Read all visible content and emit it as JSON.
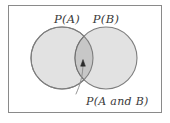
{
  "figure": {
    "type": "venn-diagram",
    "caption_set_a": "P(A)",
    "caption_set_b": "P(B)",
    "caption_intersection": "P(A and B)",
    "frame": {
      "x": 8,
      "y": 5,
      "width": 154,
      "height": 108,
      "border_color": "#8a8a8a",
      "background_color": "#ffffff"
    },
    "circles": [
      {
        "name": "circle-a",
        "label": "P(A)",
        "cx": 62,
        "cy": 58,
        "r": 31,
        "fill": "#e2e2e2",
        "stroke": "#7e7e7e"
      },
      {
        "name": "circle-b",
        "label": "P(B)",
        "cx": 106,
        "cy": 58,
        "r": 31,
        "fill": "#e2e2e2",
        "stroke": "#7e7e7e"
      }
    ],
    "intersection": {
      "label": "P(A and B)",
      "fill": "#c7c7c7",
      "stroke": "#6f6f6f"
    },
    "annotation": {
      "arrow_tip_x": 83,
      "arrow_tip_y": 60,
      "arrow_color": "#2b2b2b",
      "leader_color": "#8a8a8a"
    },
    "labels": {
      "set_a_x": 67,
      "set_a_y": 23,
      "set_b_x": 106,
      "set_b_y": 23,
      "intersection_x": 86,
      "intersection_y": 105
    }
  }
}
